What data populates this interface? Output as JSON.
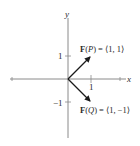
{
  "diagram": {
    "type": "vector-diagram",
    "axes": {
      "x_label": "x",
      "y_label": "y",
      "x_ticks": [
        {
          "value": 1,
          "label": "1"
        }
      ],
      "y_ticks": [
        {
          "value": 1,
          "label": "1"
        },
        {
          "value": -1,
          "label": "−1"
        }
      ]
    },
    "vectors": [
      {
        "name": "F(P)",
        "from": [
          0,
          0
        ],
        "to": [
          1,
          1
        ],
        "label_func": "F",
        "label_point": "P",
        "label_value": "= ⟨1, 1⟩"
      },
      {
        "name": "F(Q)",
        "from": [
          0,
          0
        ],
        "to": [
          1,
          -1
        ],
        "label_func": "F",
        "label_point": "Q",
        "label_value": "= ⟨1, −1⟩"
      }
    ],
    "colors": {
      "axis": "#8a8a8a",
      "vector": "#1a1a1a",
      "text": "#2a2a2a",
      "background": "#ffffff"
    }
  }
}
